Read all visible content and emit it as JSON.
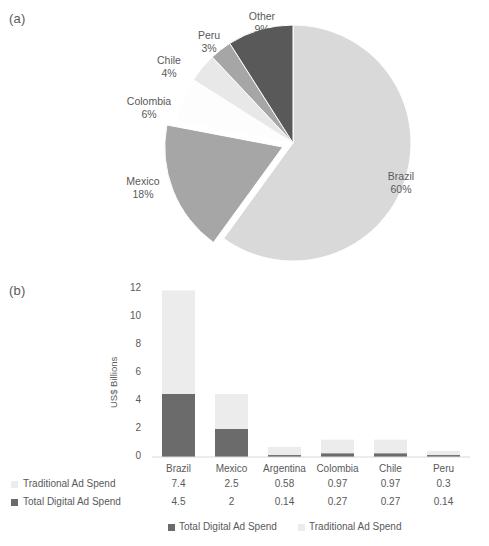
{
  "figure": {
    "top_clipped_title": "",
    "panel_a_label": "(a)",
    "panel_b_label": "(b)"
  },
  "colors": {
    "brazil_light": "#d9d9d9",
    "mexico_mid": "#a6a6a6",
    "other_dark": "#595959",
    "peru_mid": "#a6a6a6",
    "chile_pale": "#e8e8e8",
    "colombia_white": "#fdfdfd",
    "digital_dark": "#6b6b6b",
    "traditional_light": "#ececec",
    "text": "#595959"
  },
  "chart_data": [
    {
      "type": "pie",
      "title": "",
      "panel": "(a)",
      "labels": [
        "Brazil",
        "Mexico",
        "Colombia",
        "Chile",
        "Peru",
        "Other"
      ],
      "values": [
        60,
        18,
        6,
        4,
        3,
        9
      ],
      "value_labels": [
        "60%",
        "18%",
        "6%",
        "4%",
        "3%",
        "9%"
      ],
      "unit": "%",
      "slice_colors": [
        "#d9d9d9",
        "#a6a6a6",
        "#fdfdfd",
        "#e8e8e8",
        "#a6a6a6",
        "#595959"
      ],
      "legend": "none",
      "labels_position": "outside"
    },
    {
      "type": "bar",
      "subtype": "stacked",
      "panel": "(b)",
      "title": "",
      "xlabel": "",
      "ylabel": "US$ Billions",
      "categories": [
        "Brazil",
        "Mexico",
        "Argentina",
        "Colombia",
        "Chile",
        "Peru"
      ],
      "ylim": [
        0,
        12
      ],
      "yticks": [
        0,
        2,
        4,
        6,
        8,
        10,
        12
      ],
      "ytick_labels": [
        "0",
        "2",
        "4",
        "6",
        "8",
        "10",
        "12"
      ],
      "grid": false,
      "legend_position": "bottom",
      "series": [
        {
          "name": "Total Digital Ad Spend",
          "color": "#6b6b6b",
          "values": [
            4.5,
            2,
            0.14,
            0.27,
            0.27,
            0.14
          ],
          "value_labels": [
            "4.5",
            "2",
            "0.14",
            "0.27",
            "0.27",
            "0.14"
          ]
        },
        {
          "name": "Traditional Ad Spend",
          "color": "#ececec",
          "values": [
            7.4,
            2.5,
            0.58,
            0.97,
            0.97,
            0.3
          ],
          "value_labels": [
            "7.4",
            "2.5",
            "0.58",
            "0.97",
            "0.97",
            "0.3"
          ]
        }
      ],
      "data_table": {
        "row_order": [
          "Traditional Ad Spend",
          "Total Digital Ad Spend"
        ],
        "rows": [
          {
            "label": "Traditional Ad Spend",
            "swatch": "#ececec",
            "cells": [
              "7.4",
              "2.5",
              "0.58",
              "0.97",
              "0.97",
              "0.3"
            ]
          },
          {
            "label": "Total Digital Ad Spend",
            "swatch": "#6b6b6b",
            "cells": [
              "4.5",
              "2",
              "0.14",
              "0.27",
              "0.27",
              "0.14"
            ]
          }
        ]
      },
      "legend_entries": [
        {
          "label": "Total Digital Ad Spend",
          "color": "#6b6b6b"
        },
        {
          "label": "Traditional Ad Spend",
          "color": "#ececec"
        }
      ]
    }
  ]
}
